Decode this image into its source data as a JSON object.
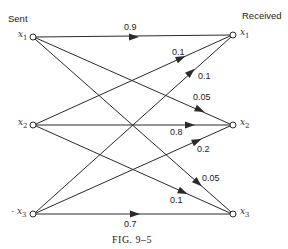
{
  "diagram": {
    "headers": {
      "sent": "Sent",
      "received": "Received"
    },
    "sent_nodes": [
      {
        "id": "x1",
        "var": "x",
        "sub": "1",
        "prefix": ""
      },
      {
        "id": "x2",
        "var": "x",
        "sub": "2",
        "prefix": ""
      },
      {
        "id": "x3",
        "var": "x",
        "sub": "3",
        "prefix": "- "
      }
    ],
    "received_nodes": [
      {
        "id": "x1",
        "var": "x",
        "sub": "1"
      },
      {
        "id": "x2",
        "var": "x",
        "sub": "2"
      },
      {
        "id": "x3",
        "var": "x",
        "sub": "3"
      }
    ],
    "edges": [
      {
        "from": "x1",
        "to": "x1",
        "prob": "0.9"
      },
      {
        "from": "x2",
        "to": "x1",
        "prob": "0.1"
      },
      {
        "from": "x3",
        "to": "x1",
        "prob": "0.1"
      },
      {
        "from": "x1",
        "to": "x2",
        "prob": "0.05"
      },
      {
        "from": "x2",
        "to": "x2",
        "prob": "0.8"
      },
      {
        "from": "x3",
        "to": "x2",
        "prob": "0.2"
      },
      {
        "from": "x1",
        "to": "x3",
        "prob": "0.05"
      },
      {
        "from": "x2",
        "to": "x3",
        "prob": "0.1"
      },
      {
        "from": "x3",
        "to": "x3",
        "prob": "0.7"
      }
    ],
    "caption": "FIG. 9–5",
    "colors": {
      "line": "#2a2a2a",
      "node_fill": "#ffffff",
      "text": "#222222"
    }
  }
}
